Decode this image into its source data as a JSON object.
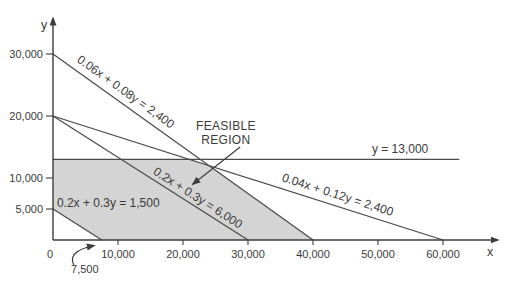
{
  "colors": {
    "background": "#ffffff",
    "axis": "#3d3d3d",
    "line": "#4a4a4a",
    "region_fill": "#d4d4d4",
    "text": "#3a3a3a"
  },
  "chart_data": {
    "type": "line",
    "subtype": "linear-programming-feasible-region",
    "xlabel": "x",
    "ylabel": "y",
    "xlim": [
      0,
      69000
    ],
    "ylim": [
      0,
      37000
    ],
    "grid": false,
    "x_ticks": [
      {
        "v": 0,
        "label": "0"
      },
      {
        "v": 10000,
        "label": "10,000"
      },
      {
        "v": 20000,
        "label": "20,000"
      },
      {
        "v": 30000,
        "label": "30,000"
      },
      {
        "v": 40000,
        "label": "40,000"
      },
      {
        "v": 50000,
        "label": "50,000"
      },
      {
        "v": 60000,
        "label": "60,000"
      }
    ],
    "y_ticks": [
      {
        "v": 5000,
        "label": "5,000"
      },
      {
        "v": 10000,
        "label": "10,000"
      },
      {
        "v": 20000,
        "label": "20,000"
      },
      {
        "v": 30000,
        "label": "30,000"
      }
    ],
    "constraint_lines": [
      {
        "equation": "0.06x + 0.08y = 2,400",
        "x_intercept": 40000,
        "y_intercept": 30000,
        "points": [
          [
            0,
            30000
          ],
          [
            40000,
            0
          ]
        ],
        "label_at": [
          11200,
          23900
        ],
        "label_rotated": true
      },
      {
        "equation": "0.2x + 0.3y = 6,000",
        "x_intercept": 30000,
        "y_intercept": 20000,
        "points": [
          [
            0,
            20000
          ],
          [
            30000,
            0
          ]
        ],
        "label_at": [
          22300,
          6800
        ],
        "label_rotated": true
      },
      {
        "equation": "0.04x + 0.12y = 2,400",
        "x_intercept": 60000,
        "y_intercept": 20000,
        "points": [
          [
            0,
            20000
          ],
          [
            60000,
            0
          ]
        ],
        "label_at": [
          43800,
          7300
        ],
        "label_rotated": true
      },
      {
        "equation": "y = 13,000",
        "y_intercept": 13000,
        "points": [
          [
            0,
            13000
          ],
          [
            62500,
            13000
          ]
        ],
        "label_at": [
          53400,
          14600
        ],
        "label_rotated": false
      },
      {
        "equation": "0.2x + 0.3y = 1,500",
        "x_intercept": 7500,
        "y_intercept": 5000,
        "points": [
          [
            0,
            5000
          ],
          [
            7500,
            0
          ]
        ],
        "label_at": [
          8500,
          6000
        ],
        "label_rotated": false
      }
    ],
    "feasible_region": {
      "label_lines": [
        "FEASIBLE",
        "REGION"
      ],
      "label_at": [
        26600,
        17300
      ],
      "arrow": {
        "from": [
          28800,
          15000
        ],
        "to": [
          21500,
          9000
        ]
      },
      "vertices": [
        [
          0,
          5000
        ],
        [
          0,
          13000
        ],
        [
          21000,
          13000
        ],
        [
          24000,
          12000
        ],
        [
          40000,
          0
        ],
        [
          7500,
          0
        ]
      ]
    },
    "callouts": [
      {
        "text": "7,500",
        "points_to": [
          7500,
          0
        ],
        "label_at": [
          4900,
          -4700
        ]
      }
    ]
  }
}
